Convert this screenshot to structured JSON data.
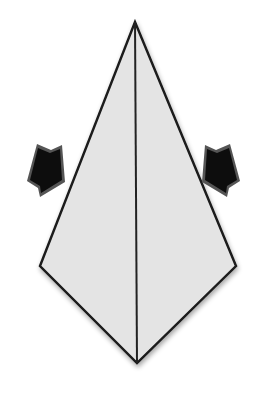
{
  "diagram": {
    "type": "origami-step",
    "colors": {
      "paper": "#e4e4e4",
      "outline": "#1a1a1a",
      "arrow_fill": "#0d0d0d",
      "arrow_edge": "#555555",
      "background": "#ffffff"
    },
    "shape": {
      "apex_top": [
        135,
        22
      ],
      "corner_left": [
        40,
        266
      ],
      "corner_right": [
        236,
        266
      ],
      "apex_bottom": [
        137,
        363
      ]
    },
    "crease": {
      "from": [
        135,
        22
      ],
      "to": [
        137,
        363
      ]
    },
    "arrows": [
      {
        "id": "left",
        "direction": "inward-right",
        "icon": "push-arrow-icon"
      },
      {
        "id": "right",
        "direction": "inward-left",
        "icon": "push-arrow-icon"
      }
    ]
  }
}
